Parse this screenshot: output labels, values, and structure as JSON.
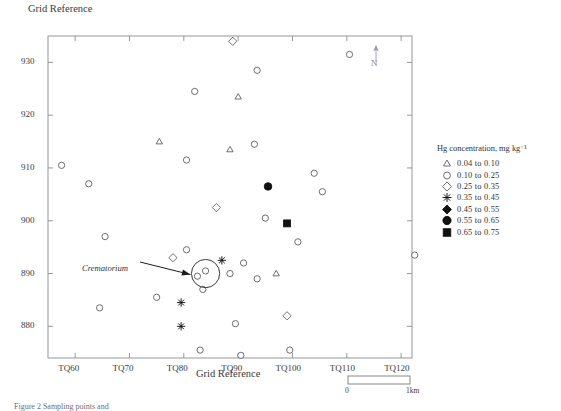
{
  "figure": {
    "axis_title_top": "Grid Reference",
    "axis_title_bottom": "Grid Reference",
    "caption": "Figure 2 Sampling points and",
    "north_label": "N"
  },
  "legend": {
    "title": "Hg concentration, mg kg⁻¹",
    "entries": [
      {
        "symbol": "triangle-open",
        "from": "0.04",
        "to": "0.10",
        "label": "0.04  to  0.10"
      },
      {
        "symbol": "circle-open",
        "from": "0.10",
        "to": "0.25",
        "label": "0.10  to  0.25"
      },
      {
        "symbol": "diamond-open",
        "from": "0.25",
        "to": "0.35",
        "label": "0.25  to  0.35"
      },
      {
        "symbol": "asterisk",
        "from": "0.35",
        "to": "0.45",
        "label": "0.35  to  0.45"
      },
      {
        "symbol": "diamond-filled",
        "from": "0.45",
        "to": "0.55",
        "label": "0.45  to  0.55"
      },
      {
        "symbol": "circle-filled",
        "from": "0.55",
        "to": "0.65",
        "label": "0.55  to  0.65"
      },
      {
        "symbol": "square-filled",
        "from": "0.65",
        "to": "0.75",
        "label": "0.65  to  0.75"
      }
    ]
  },
  "annotations": {
    "site_label": "Crematorium"
  },
  "scalebar": {
    "min_label": "0",
    "max_label": "1km"
  },
  "chart_data": {
    "type": "scatter",
    "title": "",
    "xlabel": "Grid Reference",
    "ylabel": "Grid Reference",
    "grid": false,
    "legend_position": "right",
    "xlim": [
      55,
      122
    ],
    "ylim": [
      874,
      935
    ],
    "xticks": [
      60,
      70,
      80,
      90,
      100,
      110,
      120
    ],
    "xticklabels": [
      "TQ60",
      "TQ70",
      "TQ80",
      "TQ90",
      "TQ100",
      "TQ110",
      "TQ120"
    ],
    "yticks": [
      880,
      890,
      900,
      910,
      920,
      930
    ],
    "yticklabels": [
      "880",
      "890",
      "900",
      "910",
      "920",
      "930"
    ],
    "classes": [
      {
        "name": "0.04 to 0.10",
        "symbol": "triangle-open"
      },
      {
        "name": "0.10 to 0.25",
        "symbol": "circle-open"
      },
      {
        "name": "0.25 to 0.35",
        "symbol": "diamond-open"
      },
      {
        "name": "0.35 to 0.45",
        "symbol": "asterisk"
      },
      {
        "name": "0.45 to 0.55",
        "symbol": "diamond-filled"
      },
      {
        "name": "0.55 to 0.65",
        "symbol": "circle-filled"
      },
      {
        "name": "0.65 to 0.75",
        "symbol": "square-filled"
      }
    ],
    "points": [
      {
        "x": 89.0,
        "y": 934.0,
        "symbol": "diamond-open"
      },
      {
        "x": 110.5,
        "y": 931.5,
        "symbol": "circle-open"
      },
      {
        "x": 93.5,
        "y": 928.5,
        "symbol": "circle-open"
      },
      {
        "x": 82.0,
        "y": 924.5,
        "symbol": "circle-open"
      },
      {
        "x": 90.0,
        "y": 923.5,
        "symbol": "triangle-open"
      },
      {
        "x": 75.5,
        "y": 915.0,
        "symbol": "triangle-open"
      },
      {
        "x": 88.5,
        "y": 913.5,
        "symbol": "triangle-open"
      },
      {
        "x": 93.0,
        "y": 914.5,
        "symbol": "circle-open"
      },
      {
        "x": 80.5,
        "y": 911.5,
        "symbol": "circle-open"
      },
      {
        "x": 57.5,
        "y": 910.5,
        "symbol": "circle-open"
      },
      {
        "x": 62.5,
        "y": 907.0,
        "symbol": "circle-open"
      },
      {
        "x": 104.0,
        "y": 909.0,
        "symbol": "circle-open"
      },
      {
        "x": 95.5,
        "y": 906.5,
        "symbol": "circle-filled"
      },
      {
        "x": 105.5,
        "y": 905.5,
        "symbol": "circle-open"
      },
      {
        "x": 86.0,
        "y": 902.5,
        "symbol": "diamond-open"
      },
      {
        "x": 65.5,
        "y": 897.0,
        "symbol": "circle-open"
      },
      {
        "x": 95.0,
        "y": 900.5,
        "symbol": "circle-open"
      },
      {
        "x": 99.0,
        "y": 899.5,
        "symbol": "square-filled"
      },
      {
        "x": 101.0,
        "y": 896.0,
        "symbol": "circle-open"
      },
      {
        "x": 80.5,
        "y": 894.5,
        "symbol": "circle-open"
      },
      {
        "x": 78.0,
        "y": 893.0,
        "symbol": "diamond-open"
      },
      {
        "x": 91.0,
        "y": 892.0,
        "symbol": "circle-open"
      },
      {
        "x": 87.0,
        "y": 892.5,
        "symbol": "asterisk"
      },
      {
        "x": 84.0,
        "y": 890.5,
        "symbol": "circle-open"
      },
      {
        "x": 82.5,
        "y": 889.5,
        "symbol": "circle-open"
      },
      {
        "x": 88.5,
        "y": 890.0,
        "symbol": "circle-open"
      },
      {
        "x": 97.0,
        "y": 890.0,
        "symbol": "triangle-open"
      },
      {
        "x": 93.5,
        "y": 889.0,
        "symbol": "circle-open"
      },
      {
        "x": 83.5,
        "y": 887.0,
        "symbol": "circle-open"
      },
      {
        "x": 75.0,
        "y": 885.5,
        "symbol": "circle-open"
      },
      {
        "x": 79.5,
        "y": 884.5,
        "symbol": "asterisk"
      },
      {
        "x": 64.5,
        "y": 883.5,
        "symbol": "circle-open"
      },
      {
        "x": 99.0,
        "y": 882.0,
        "symbol": "diamond-open"
      },
      {
        "x": 79.5,
        "y": 880.0,
        "symbol": "asterisk"
      },
      {
        "x": 89.5,
        "y": 880.5,
        "symbol": "circle-open"
      },
      {
        "x": 83.0,
        "y": 875.5,
        "symbol": "circle-open"
      },
      {
        "x": 90.5,
        "y": 874.5,
        "symbol": "circle-open"
      },
      {
        "x": 99.5,
        "y": 875.5,
        "symbol": "circle-open"
      },
      {
        "x": 122.5,
        "y": 893.5,
        "symbol": "circle-open"
      }
    ],
    "site_marker": {
      "x": 84.0,
      "y": 890.0,
      "radius_units": 2.6,
      "label": "Crematorium"
    }
  }
}
